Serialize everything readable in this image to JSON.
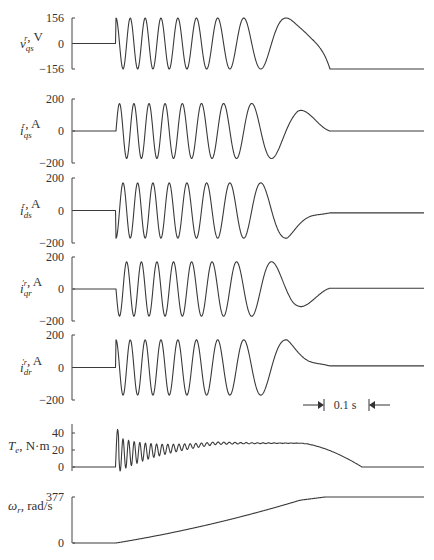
{
  "chart_data": [
    {
      "id": "vqs",
      "type": "line",
      "ylabel": {
        "sym": "v",
        "sup": "r",
        "sub": "qs",
        "unit": ", V"
      },
      "ylim": [
        -156,
        156
      ],
      "yticks": [
        156,
        0,
        -156
      ],
      "ytick_labels": [
        "156",
        "0",
        "−156"
      ],
      "x_range_s": [
        0,
        0.5
      ],
      "description": "Zero before start (~0.1 s), then sinusoid of amplitude 156 V whose frequency decreases as rotor accelerates; settles to -156 (dc) after ~0.32 s",
      "onset_s": 0.1,
      "amplitude": 156,
      "final_value": -156
    },
    {
      "id": "iqs",
      "type": "line",
      "ylabel": {
        "sym": "i",
        "sup": "r",
        "sub": "qs",
        "unit": ", A"
      },
      "ylim": [
        -200,
        200
      ],
      "yticks": [
        200,
        0,
        -200
      ],
      "ytick_labels": [
        "200",
        "0",
        "−200"
      ],
      "onset_s": 0.1,
      "amplitude": 185,
      "final_value": 0
    },
    {
      "id": "ids",
      "type": "line",
      "ylabel": {
        "sym": "i",
        "sup": "r",
        "sub": "ds",
        "unit": ", A"
      },
      "ylim": [
        -200,
        200
      ],
      "yticks": [
        200,
        0,
        -200
      ],
      "ytick_labels": [
        "200",
        "0",
        "−200"
      ],
      "onset_s": 0.1,
      "amplitude": 185,
      "final_value": -15
    },
    {
      "id": "iqr",
      "type": "line",
      "ylabel": {
        "sym": "i",
        "sup": "′r",
        "sub": "qr",
        "unit": ", A"
      },
      "ylim": [
        -200,
        200
      ],
      "yticks": [
        200,
        0,
        -200
      ],
      "ytick_labels": [
        "200",
        "0",
        "−200"
      ],
      "onset_s": 0.1,
      "amplitude": 185,
      "final_value": 5
    },
    {
      "id": "idr",
      "type": "line",
      "ylabel": {
        "sym": "i",
        "sup": "′r",
        "sub": "dr",
        "unit": ", A"
      },
      "ylim": [
        -200,
        200
      ],
      "yticks": [
        200,
        0,
        -200
      ],
      "ytick_labels": [
        "200",
        "0",
        "−200"
      ],
      "onset_s": 0.1,
      "amplitude": 185,
      "final_value": 10
    },
    {
      "id": "te",
      "type": "line",
      "ylabel": {
        "sym": "T",
        "sup": "",
        "sub": "e",
        "unit": ", N·m"
      },
      "ylim": [
        -8,
        48
      ],
      "yticks": [
        40,
        20,
        0
      ],
      "ytick_labels": [
        "40",
        "20",
        "0"
      ],
      "onset_s": 0.1,
      "peak": 45,
      "plateau": 28,
      "final_value": 0
    },
    {
      "id": "wr",
      "type": "line",
      "ylabel": {
        "sym": "ω",
        "sup": "",
        "sub": "r",
        "unit": ", rad/s"
      },
      "ylim": [
        0,
        377
      ],
      "yticks": [
        377,
        0
      ],
      "ytick_labels": [
        "377",
        "0"
      ],
      "onset_s": 0.1,
      "final_value": 377
    }
  ],
  "time_scale": {
    "label": "0.1 s",
    "duration_s": 0.1
  }
}
